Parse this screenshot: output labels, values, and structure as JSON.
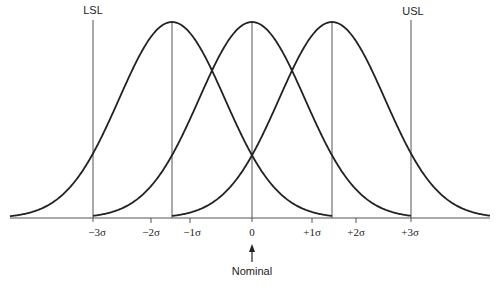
{
  "chart_data": {
    "type": "line",
    "title": "",
    "xlabel": "",
    "ylabel": "",
    "spec_limits": {
      "lower_label": "LSL",
      "upper_label": "USL",
      "lower_at": "-3σ",
      "upper_at": "+3σ"
    },
    "tick_labels": [
      "−3σ",
      "−2σ",
      "−1σ",
      "0",
      "+1σ",
      "+2σ",
      "+3σ"
    ],
    "tick_values": [
      -3,
      -2,
      -1,
      0,
      1,
      2,
      3
    ],
    "series": [
      {
        "name": "shifted-left",
        "mean": -1.5,
        "sd": 1
      },
      {
        "name": "centered",
        "mean": 0,
        "sd": 1
      },
      {
        "name": "shifted-right",
        "mean": 1.5,
        "sd": 1
      }
    ],
    "annotations": [
      {
        "text": "Nominal",
        "at": 0,
        "arrow": "up"
      }
    ],
    "grid": false
  },
  "labels": {
    "lsl": "LSL",
    "usl": "USL",
    "nominal": "Nominal",
    "ticks": [
      "−3σ",
      "−2σ",
      "−1σ",
      "0",
      "+1σ",
      "+2σ",
      "+3σ"
    ]
  }
}
